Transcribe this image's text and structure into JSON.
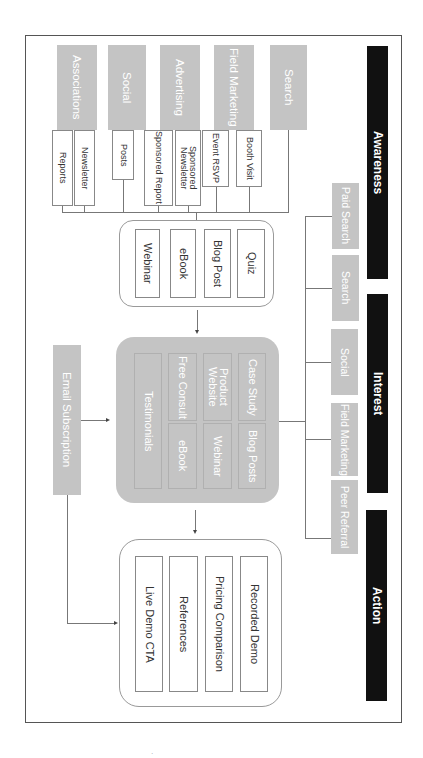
{
  "phases": [
    {
      "label": "Awareness",
      "color": "#111111"
    },
    {
      "label": "Interest",
      "color": "#111111"
    },
    {
      "label": "Action",
      "color": "#111111"
    }
  ],
  "awareness": {
    "categories": [
      {
        "label": "Associations",
        "items": [
          "Reports",
          "Newsletter"
        ]
      },
      {
        "label": "Social",
        "items": [
          "Posts"
        ]
      },
      {
        "label": "Advertising",
        "items": [
          "Sponsored Report",
          "Sponsored Newsletter"
        ]
      },
      {
        "label": "Field Marketing",
        "items": [
          "Event RSVP",
          "Booth Visit"
        ]
      },
      {
        "label": "Search",
        "items": []
      }
    ],
    "content_box": [
      "Webinar",
      "eBook",
      "Blog Post",
      "Quiz"
    ]
  },
  "interest": {
    "channels": [
      "Paid Search",
      "Search",
      "Social",
      "Field Marketing",
      "Peer Referral"
    ],
    "content_box": {
      "grid": [
        "Case Study",
        "Blog Posts",
        "Product Website",
        "Webinar",
        "Free Consult",
        "eBook"
      ],
      "wide": "Testimonials"
    },
    "email": "Email Subscription"
  },
  "action": {
    "content_box": [
      "Recorded Demo",
      "Pricing Comparison",
      "References",
      "Live Demo CTA"
    ]
  },
  "colors": {
    "phase_bar": "#111111",
    "category_gray": "#c4c4c4",
    "line": "#777777",
    "frame": "#555555"
  },
  "footer_mark": "·"
}
